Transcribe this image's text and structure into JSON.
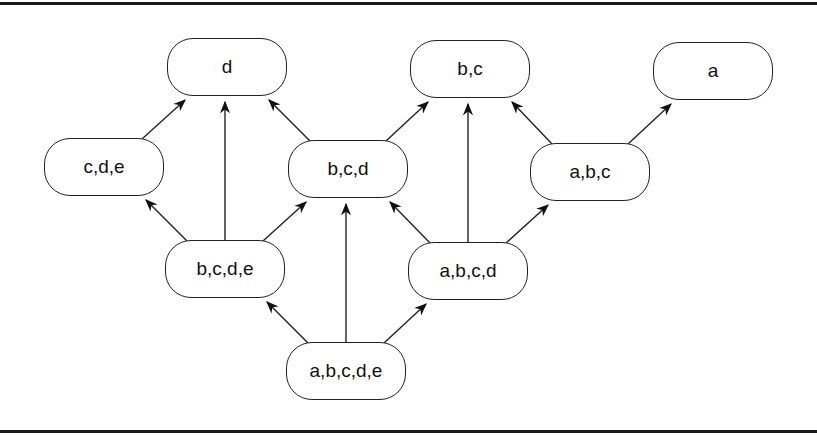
{
  "diagram": {
    "type": "lattice",
    "nodes": [
      {
        "id": "d",
        "label": "d",
        "x": 167,
        "y": 38
      },
      {
        "id": "bc",
        "label": "b,c",
        "x": 410,
        "y": 40
      },
      {
        "id": "a",
        "label": "a",
        "x": 653,
        "y": 42
      },
      {
        "id": "cde",
        "label": "c,d,e",
        "x": 44,
        "y": 138
      },
      {
        "id": "bcd",
        "label": "b,c,d",
        "x": 288,
        "y": 140
      },
      {
        "id": "abc",
        "label": "a,b,c",
        "x": 530,
        "y": 143
      },
      {
        "id": "bcde",
        "label": "b,c,d,e",
        "x": 165,
        "y": 240
      },
      {
        "id": "abcd",
        "label": "a,b,c,d",
        "x": 408,
        "y": 242
      },
      {
        "id": "abcde",
        "label": "a,b,c,d,e",
        "x": 286,
        "y": 342
      }
    ],
    "edges": [
      {
        "from": "cde",
        "to": "d"
      },
      {
        "from": "bcde",
        "to": "d"
      },
      {
        "from": "bcd",
        "to": "d"
      },
      {
        "from": "bcd",
        "to": "bc"
      },
      {
        "from": "abcd",
        "to": "bc"
      },
      {
        "from": "abc",
        "to": "bc"
      },
      {
        "from": "abc",
        "to": "a"
      },
      {
        "from": "bcde",
        "to": "cde"
      },
      {
        "from": "bcde",
        "to": "bcd"
      },
      {
        "from": "abcde",
        "to": "bcd"
      },
      {
        "from": "abcd",
        "to": "bcd"
      },
      {
        "from": "abcd",
        "to": "abc"
      },
      {
        "from": "abcde",
        "to": "bcde"
      },
      {
        "from": "abcde",
        "to": "abcd"
      }
    ]
  }
}
